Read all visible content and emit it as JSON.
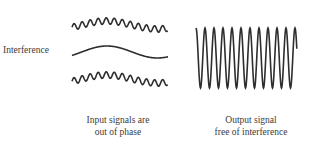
{
  "diagram": {
    "labels": {
      "interference": "Interference",
      "input_caption_line1": "Input signals are",
      "input_caption_line2": "out of phase",
      "output_caption_line1": "Output signal",
      "output_caption_line2": "free of interference"
    },
    "colors": {
      "stroke": "#2e2e2e",
      "text": "#3a3a3a",
      "background": "#ffffff"
    }
  }
}
